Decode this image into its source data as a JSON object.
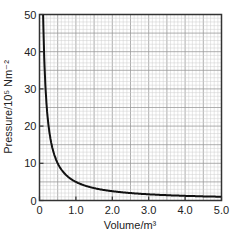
{
  "chart_data": {
    "type": "line",
    "title": "",
    "xlabel": "Volume/m³",
    "ylabel": "Pressure/10⁵ Nm⁻²",
    "xlim": [
      0,
      5.0
    ],
    "ylim": [
      0,
      50
    ],
    "x_ticks": [
      "0",
      "1.0",
      "2.0",
      "3.0",
      "4.0",
      "5.0"
    ],
    "y_ticks": [
      "0",
      "10",
      "20",
      "30",
      "40",
      "50"
    ],
    "grid": true,
    "legend": null,
    "series": [
      {
        "name": "P = 5/V",
        "x": [
          0.1,
          0.15,
          0.2,
          0.25,
          0.3,
          0.4,
          0.5,
          0.6,
          0.8,
          1.0,
          1.5,
          2.0,
          2.5,
          3.0,
          3.5,
          4.0,
          4.5,
          5.0
        ],
        "y": [
          50,
          33.3,
          25,
          20,
          16.7,
          12.5,
          10,
          8.3,
          6.25,
          5,
          3.33,
          2.5,
          2,
          1.67,
          1.43,
          1.25,
          1.11,
          1.0
        ]
      }
    ]
  }
}
